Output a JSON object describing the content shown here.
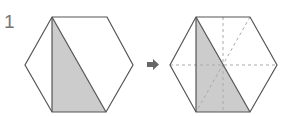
{
  "problem": {
    "number": "1"
  },
  "figure": {
    "before": {
      "shape": "regular-hexagon",
      "shaded": "triangle from top-left vertex to bottom-left and bottom-right vertices"
    },
    "arrow": "right-arrow",
    "after": {
      "shape": "regular-hexagon",
      "shaded": "same triangle",
      "dashed_lines": [
        "horizontal diagonal",
        "vertical line through center",
        "diagonal top-right to bottom-left"
      ]
    },
    "colors": {
      "line": "#555555",
      "fill": "#cccccc",
      "dashed": "#aaaaaa",
      "arrow": "#666666"
    }
  }
}
